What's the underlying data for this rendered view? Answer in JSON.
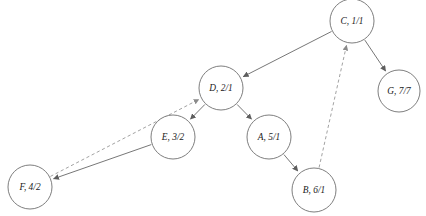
{
  "diagram": {
    "background_color": "#ffffff",
    "node_stroke_color": "#6f6f6f",
    "node_fill_color": "#ffffff",
    "solid_edge_color": "#5e5e5e",
    "dashed_edge_color": "#8a8a8a",
    "label_color": "#1a1a1a",
    "nodes": [
      {
        "id": "C",
        "label": "C, 1/1",
        "cx": 352,
        "cy": 21,
        "r": 22
      },
      {
        "id": "D",
        "label": "D, 2/1",
        "cx": 221,
        "cy": 88,
        "r": 22
      },
      {
        "id": "G",
        "label": "G, 7/7",
        "cx": 399,
        "cy": 91,
        "r": 21
      },
      {
        "id": "E",
        "label": "E, 3/2",
        "cx": 173,
        "cy": 137,
        "r": 22
      },
      {
        "id": "A",
        "label": "A, 5/1",
        "cx": 269,
        "cy": 137,
        "r": 22
      },
      {
        "id": "F",
        "label": "F, 4/2",
        "cx": 30,
        "cy": 187,
        "r": 22
      },
      {
        "id": "B",
        "label": "B, 6/1",
        "cx": 314,
        "cy": 190,
        "r": 22
      }
    ],
    "edges": [
      {
        "from": "C",
        "to": "D",
        "style": "solid",
        "arrow": true
      },
      {
        "from": "C",
        "to": "G",
        "style": "solid",
        "arrow": true
      },
      {
        "from": "D",
        "to": "E",
        "style": "solid",
        "arrow": true
      },
      {
        "from": "D",
        "to": "A",
        "style": "solid",
        "arrow": true
      },
      {
        "from": "A",
        "to": "B",
        "style": "solid",
        "arrow": true
      },
      {
        "from": "E",
        "to": "F",
        "style": "solid",
        "arrow": true
      },
      {
        "from": "F",
        "to": "D",
        "style": "dashed",
        "arrow": true
      },
      {
        "from": "B",
        "to": "C",
        "style": "dashed",
        "arrow": true
      }
    ]
  }
}
